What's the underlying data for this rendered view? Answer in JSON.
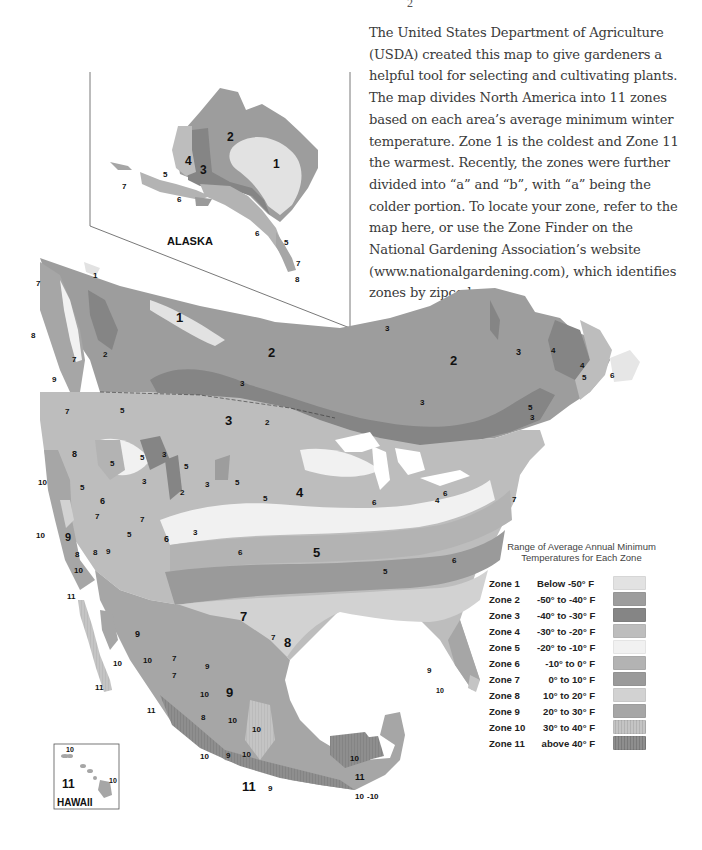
{
  "page": {
    "page_number_fragment": "2",
    "intro_text": "The United States Department of Agriculture (USDA) created this map to give gardeners a helpful tool for selecting and cultivating plants. The map divides North America into 11 zones based on each area’s average minimum winter temperature. Zone 1 is the coldest and Zone 11 the warmest. Recently, the zones were further divided into “a” and “b”, with “a” being the colder portion. To locate your zone, refer to the map here, or use the Zone Finder on the National Gardening Association’s website (www.nationalgardening.com), which identifies zones by zipcode."
  },
  "map": {
    "title": "USDA Plant Hardiness Zone Map of North America",
    "insets": {
      "alaska": {
        "name": "ALASKA",
        "labels": [
          "1",
          "2",
          "3",
          "4",
          "5",
          "5",
          "6",
          "6",
          "7",
          "7",
          "8"
        ]
      },
      "hawaii": {
        "name": "HAWAII",
        "labels": [
          "11",
          "10",
          "10"
        ]
      }
    },
    "main_labels": {
      "canada": [
        "1",
        "1",
        "2",
        "2",
        "2",
        "3",
        "3",
        "3",
        "3",
        "3",
        "3",
        "4",
        "4",
        "5",
        "5",
        "5",
        "6",
        "6",
        "7",
        "7",
        "8",
        "9"
      ],
      "usa": [
        "2",
        "2",
        "3",
        "3",
        "3",
        "3",
        "4",
        "4",
        "5",
        "5",
        "5",
        "5",
        "6",
        "6",
        "6",
        "6",
        "7",
        "7",
        "7",
        "8",
        "8",
        "8",
        "9",
        "9",
        "9",
        "10",
        "10",
        "10",
        "11"
      ],
      "mexico": [
        "7",
        "7",
        "8",
        "9",
        "9",
        "9",
        "10",
        "10",
        "10",
        "10",
        "10",
        "10",
        "11",
        "11",
        "11",
        "11"
      ]
    }
  },
  "legend": {
    "title_line1": "Range of Average Annual Minimum",
    "title_line2": "Temperatures for Each Zone",
    "zones": [
      {
        "zone": "Zone 1",
        "range": "Below -50° F",
        "color": "#e2e2e2"
      },
      {
        "zone": "Zone 2",
        "range": "-50° to -40° F",
        "color": "#9d9d9d"
      },
      {
        "zone": "Zone 3",
        "range": "-40° to -30° F",
        "color": "#858585"
      },
      {
        "zone": "Zone 4",
        "range": "-30° to -20° F",
        "color": "#bdbdbd"
      },
      {
        "zone": "Zone 5",
        "range": "-20° to -10° F",
        "color": "#f1f1f1"
      },
      {
        "zone": "Zone 6",
        "range": "-10° to 0° F",
        "color": "#b3b3b3"
      },
      {
        "zone": "Zone 7",
        "range": "0° to 10° F",
        "color": "#9a9a9a"
      },
      {
        "zone": "Zone 8",
        "range": "10° to 20° F",
        "color": "#d2d2d2"
      },
      {
        "zone": "Zone 9",
        "range": "20° to 30° F",
        "color": "#a6a6a6"
      },
      {
        "zone": "Zone 10",
        "range": "30° to 40° F",
        "color": "#c4c4c4"
      },
      {
        "zone": "Zone 11",
        "range": "above 40° F",
        "color": "#8e8e8e"
      }
    ]
  }
}
